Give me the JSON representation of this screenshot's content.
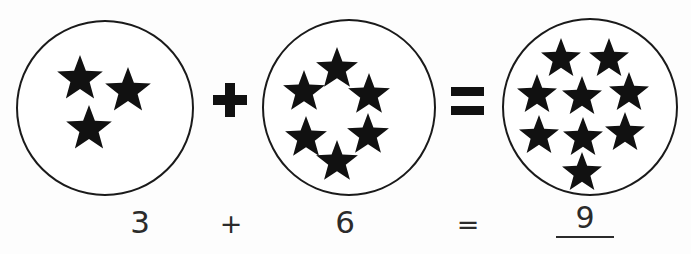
{
  "worksheet": {
    "title": "Star addition worksheet",
    "background_color": "#fdfdfd",
    "ink_color": "#111111"
  },
  "equation": {
    "addend_1": "3",
    "operator_1": "+",
    "addend_2": "6",
    "operator_2": "=",
    "sum": "9",
    "sum_is_handwritten": true,
    "sum_has_answer_line": true
  },
  "groups": [
    {
      "name": "group-one",
      "count": 3,
      "label": "3",
      "stars": [
        {
          "cx": 38,
          "cy": 33,
          "r": 24,
          "rot": 0
        },
        {
          "cx": 86,
          "cy": 45,
          "r": 24,
          "rot": 0
        },
        {
          "cx": 47,
          "cy": 83,
          "r": 24,
          "rot": 0
        }
      ]
    },
    {
      "name": "group-two",
      "count": 6,
      "label": "6",
      "stars": [
        {
          "cx": 51,
          "cy": 26,
          "r": 22,
          "rot": 0
        },
        {
          "cx": 18,
          "cy": 49,
          "r": 22,
          "rot": 0
        },
        {
          "cx": 83,
          "cy": 52,
          "r": 22,
          "rot": 0
        },
        {
          "cx": 20,
          "cy": 95,
          "r": 22,
          "rot": 0
        },
        {
          "cx": 82,
          "cy": 92,
          "r": 22,
          "rot": 0
        },
        {
          "cx": 51,
          "cy": 119,
          "r": 22,
          "rot": 0
        }
      ]
    },
    {
      "name": "group-three",
      "count": 9,
      "label": "9",
      "stars": [
        {
          "cx": 36,
          "cy": 18,
          "r": 21,
          "rot": 0
        },
        {
          "cx": 84,
          "cy": 18,
          "r": 21,
          "rot": 0
        },
        {
          "cx": 12,
          "cy": 54,
          "r": 21,
          "rot": 0
        },
        {
          "cx": 57,
          "cy": 56,
          "r": 21,
          "rot": 0
        },
        {
          "cx": 104,
          "cy": 52,
          "r": 21,
          "rot": 0
        },
        {
          "cx": 14,
          "cy": 95,
          "r": 21,
          "rot": 0
        },
        {
          "cx": 58,
          "cy": 97,
          "r": 21,
          "rot": 0
        },
        {
          "cx": 100,
          "cy": 92,
          "r": 21,
          "rot": 0
        },
        {
          "cx": 57,
          "cy": 132,
          "r": 21,
          "rot": 0
        }
      ]
    }
  ],
  "icons": {
    "star": "star-icon",
    "plus": "plus-sign-icon",
    "equals": "equals-sign-icon"
  }
}
